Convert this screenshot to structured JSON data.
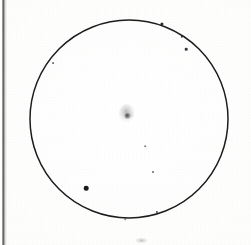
{
  "image": {
    "kind": "scanned-astronomical-observation-sketch",
    "caption": "Hand-drawn telescope field-of-view circle with a faint diffuse object near the centre and scattered stars",
    "width": 251,
    "height": 245,
    "paper_color": "#fdfdfc",
    "ink_color": "#1b1b1b"
  },
  "scan_artifacts": {
    "left_edge_strip": {
      "label": "scanner-edge-strip",
      "x": 0,
      "width": 7,
      "color": "#4a4a4a"
    },
    "bottom_smudge": {
      "label": "bottom-page-smudge",
      "cx": 141,
      "cy": 240,
      "width": 11,
      "height": 5,
      "color": "#696969"
    }
  },
  "field_of_view": {
    "label": "field-of-view-circle",
    "cx": 129,
    "cy": 119,
    "rx": 99,
    "ry": 99,
    "stroke_color": "#1c1c1c",
    "stroke_width": 1.5
  },
  "diffuse_object": {
    "label": "comet-or-nebula",
    "cx": 127,
    "cy": 114,
    "width": 17,
    "height": 20,
    "core_color": "#2e2e2e",
    "halo_color": "#9a9a9a"
  },
  "stars": [
    {
      "name": "star-top-right-bright",
      "cx": 162,
      "cy": 24,
      "r": 1.6,
      "opacity": 0.95
    },
    {
      "name": "star-upper-right-mid",
      "cx": 182,
      "cy": 37,
      "r": 1.2,
      "opacity": 0.85
    },
    {
      "name": "star-right-upper",
      "cx": 186,
      "cy": 49,
      "r": 1.3,
      "opacity": 0.88
    },
    {
      "name": "star-left-faint",
      "cx": 53,
      "cy": 63,
      "r": 0.9,
      "opacity": 0.62
    },
    {
      "name": "star-below-centre",
      "cx": 145,
      "cy": 146,
      "r": 0.8,
      "opacity": 0.52
    },
    {
      "name": "star-lower-centre",
      "cx": 153,
      "cy": 172,
      "r": 1.0,
      "opacity": 0.68
    },
    {
      "name": "star-lower-left-bright",
      "cx": 86,
      "cy": 188,
      "r": 2.3,
      "opacity": 1.0
    },
    {
      "name": "star-bottom-right",
      "cx": 157,
      "cy": 212,
      "r": 1.1,
      "opacity": 0.78
    },
    {
      "name": "star-bottom-faint",
      "cx": 125,
      "cy": 219,
      "r": 0.8,
      "opacity": 0.5
    }
  ]
}
